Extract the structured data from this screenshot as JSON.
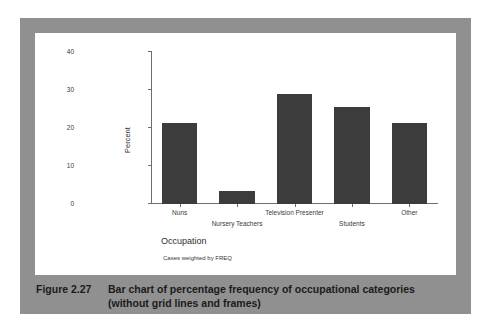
{
  "figure": {
    "caption_number": "Figure 2.27",
    "caption_text": "Bar chart of percentage frequency of occupational categories (without grid lines and frames)",
    "border_color": "#909090",
    "panel_color": "#ffffff"
  },
  "chart_data": {
    "type": "bar",
    "title": "",
    "subtitle": "",
    "categories": [
      "Nuns",
      "Nursery Teachers",
      "Television Presenter",
      "Students",
      "Other"
    ],
    "values": [
      21.4,
      3.4,
      29.0,
      25.6,
      21.3
    ],
    "xlabel": "Occupation",
    "ylabel": "Percent",
    "ylim": [
      0,
      40
    ],
    "yticks": [
      0,
      10,
      20,
      30,
      40
    ],
    "ytick_labels": [
      "0",
      "10",
      "20",
      "30",
      "40"
    ],
    "grid": false,
    "frame": false,
    "legend": "none",
    "footnote": "Cases weighted by FREQ",
    "bar_color": "#3c3c3c",
    "axis_color": "#6e6e6e"
  }
}
